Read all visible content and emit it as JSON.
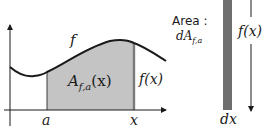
{
  "graph": {
    "curve_label": "f",
    "area_label_main": "A",
    "area_label_sub": "f,a",
    "area_label_arg": "(x)",
    "height_label": "f(x)",
    "lower_bound_label": "a",
    "upper_bound_label": "x"
  },
  "strip": {
    "area_title": "Area :",
    "area_symbol_main": "dA",
    "area_symbol_sub": "f,a",
    "height_label": "f(x)",
    "width_label": "dx"
  },
  "colors": {
    "shaded_region": "#c4c4c4",
    "strip": "#6e6e6e",
    "curve": "#1a1a1a",
    "axis": "#1a1a1a"
  }
}
